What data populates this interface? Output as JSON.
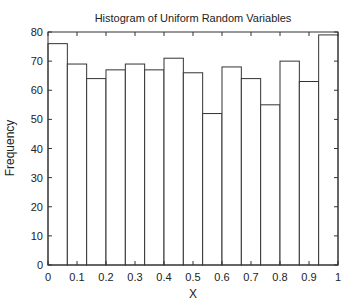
{
  "chart_data": {
    "type": "bar",
    "title": "Histogram of Uniform Random Variables",
    "xlabel": "X",
    "ylabel": "Frequency",
    "xlim": [
      0,
      1
    ],
    "ylim": [
      0,
      80
    ],
    "bins": 15,
    "bin_edges": [
      0,
      0.0667,
      0.1333,
      0.2,
      0.2667,
      0.3333,
      0.4,
      0.4667,
      0.5333,
      0.6,
      0.6667,
      0.7333,
      0.8,
      0.8667,
      0.9333,
      1.0
    ],
    "values": [
      76,
      69,
      64,
      67,
      69,
      67,
      71,
      66,
      52,
      68,
      64,
      55,
      70,
      63,
      79
    ],
    "xticks": [
      "0",
      "0.1",
      "0.2",
      "0.3",
      "0.4",
      "0.5",
      "0.6",
      "0.7",
      "0.8",
      "0.9",
      "1"
    ],
    "yticks": [
      "0",
      "10",
      "20",
      "30",
      "40",
      "50",
      "60",
      "70",
      "80"
    ],
    "grid": false,
    "legend": null,
    "bar_fill": "#ffffff",
    "bar_edge": "#333333"
  }
}
